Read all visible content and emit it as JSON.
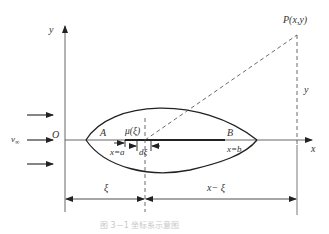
{
  "diagram": {
    "type": "airfoil thin-wing coordinate system",
    "axes": {
      "x_label": "x",
      "y_label": "y",
      "origin_label": "O"
    },
    "freestream": {
      "label": "v",
      "subscript": "∞",
      "arrow_count": 3
    },
    "airfoil": {
      "leading_label": "A",
      "trailing_label": "B",
      "leading_position": "x=a",
      "trailing_position": "x=b",
      "source_label": "μ(ξ)",
      "element_label": "dξ"
    },
    "point": {
      "label": "P(x,y)",
      "height_label": "y"
    },
    "dimensions": {
      "left": "ξ",
      "right": "x− ξ"
    },
    "caption": "图 3－1   坐标系示意图"
  }
}
